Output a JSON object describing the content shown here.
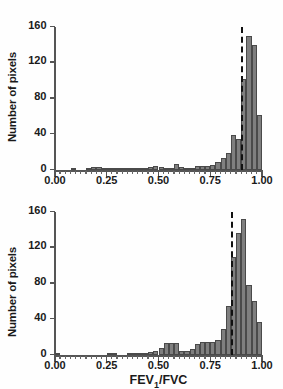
{
  "figure": {
    "panel_count": 2,
    "background_color": "#ffffff",
    "bar_fill_color": "#7f7f7f",
    "bar_edge_color": "#4a4a4a",
    "axis_color": "#555555",
    "threshold_line_color": "#111111"
  },
  "axes": {
    "ylabel": "Number of pixels",
    "xlabel_text": "FEV",
    "xlabel_sub": "1",
    "xlabel_tail": "/FVC",
    "xlabel_full": "FEV1/FVC",
    "yticks": [
      "0",
      "40",
      "80",
      "120",
      "160"
    ],
    "ytick_values": [
      0,
      40,
      80,
      120,
      160
    ],
    "xticks": [
      "0.00",
      "0.25",
      "0.50",
      "0.75",
      "1.00"
    ],
    "xtick_values": [
      0.0,
      0.25,
      0.5,
      0.75,
      1.0
    ],
    "xlim": [
      0.0,
      1.0
    ],
    "ylim": [
      0,
      160
    ],
    "grid": "off",
    "legend": "none"
  },
  "chart_data": [
    {
      "type": "bar",
      "id": "panel-top",
      "title": "",
      "subtitle": "",
      "xlabel": "",
      "ylabel": "Number of pixels",
      "xlim": [
        0.0,
        1.0
      ],
      "ylim": [
        0,
        160
      ],
      "grid": "off",
      "legend": "none",
      "bin_width": 0.025,
      "annotations": [
        {
          "kind": "vertical-dashed-line",
          "x": 0.9,
          "label": ""
        }
      ],
      "bin_centers": [
        0.0125,
        0.0375,
        0.0625,
        0.0875,
        0.1125,
        0.1375,
        0.1625,
        0.1875,
        0.2125,
        0.2375,
        0.2625,
        0.2875,
        0.3125,
        0.3375,
        0.3625,
        0.3875,
        0.4125,
        0.4375,
        0.4625,
        0.4875,
        0.5125,
        0.5375,
        0.5625,
        0.5875,
        0.6125,
        0.6375,
        0.6625,
        0.6875,
        0.7125,
        0.7375,
        0.7625,
        0.7875,
        0.8125,
        0.8375,
        0.8625,
        0.8875,
        0.9125,
        0.9375,
        0.9625,
        0.9875
      ],
      "values": [
        0,
        0,
        0,
        1,
        0,
        0,
        1,
        3,
        3,
        2,
        1,
        1,
        1,
        2,
        1,
        1,
        1,
        2,
        3,
        4,
        3,
        2,
        2,
        7,
        3,
        2,
        2,
        5,
        5,
        5,
        6,
        9,
        13,
        19,
        39,
        35,
        102,
        150,
        140,
        62
      ],
      "values_note": "final partial bin near 1.00 equals 44",
      "peak_value": 150,
      "peak_x": 0.9375
    },
    {
      "type": "bar",
      "id": "panel-bottom",
      "title": "",
      "subtitle": "",
      "xlabel": "FEV1/FVC",
      "ylabel": "Number of pixels",
      "xlim": [
        0.0,
        1.0
      ],
      "ylim": [
        0,
        160
      ],
      "grid": "off",
      "legend": "none",
      "bin_width": 0.025,
      "annotations": [
        {
          "kind": "vertical-dashed-line",
          "x": 0.85,
          "label": ""
        }
      ],
      "bin_centers": [
        0.0125,
        0.0375,
        0.0625,
        0.0875,
        0.1125,
        0.1375,
        0.1625,
        0.1875,
        0.2125,
        0.2375,
        0.2625,
        0.2875,
        0.3125,
        0.3375,
        0.3625,
        0.3875,
        0.4125,
        0.4375,
        0.4625,
        0.4875,
        0.5125,
        0.5375,
        0.5625,
        0.5875,
        0.6125,
        0.6375,
        0.6625,
        0.6875,
        0.7125,
        0.7375,
        0.7625,
        0.7875,
        0.8125,
        0.8375,
        0.8625,
        0.8875,
        0.9125,
        0.9375,
        0.9625,
        0.9875
      ],
      "values": [
        1,
        0,
        0,
        0,
        0,
        0,
        0,
        0,
        0,
        0,
        1,
        1,
        0,
        0,
        1,
        1,
        2,
        2,
        3,
        5,
        8,
        14,
        13,
        13,
        4,
        4,
        7,
        12,
        15,
        15,
        15,
        17,
        29,
        55,
        110,
        137,
        152,
        78,
        60,
        37
      ],
      "values_note": "tail bins near 1.00 are 23, 25, 23",
      "peak_value": 152,
      "peak_x": 0.9125
    }
  ]
}
